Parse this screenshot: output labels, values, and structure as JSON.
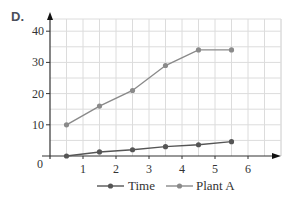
{
  "panel_label": "D.",
  "colors": {
    "time_series": "#555555",
    "plant_a_series": "#8a8a8a",
    "grid": "#dcdcdc",
    "axis": "#333333",
    "text": "#333333"
  },
  "chart_data": {
    "type": "line",
    "title": "",
    "xlabel": "",
    "ylabel": "",
    "x": [
      0.5,
      1.5,
      2.5,
      3.5,
      4.5,
      5.5
    ],
    "series": [
      {
        "name": "Time",
        "values": [
          0,
          1.3,
          2,
          3,
          3.6,
          4.6
        ]
      },
      {
        "name": "Plant A",
        "values": [
          10,
          16,
          21,
          29,
          34,
          34
        ]
      }
    ],
    "xlim": [
      0,
      7
    ],
    "ylim": [
      0,
      43
    ],
    "x_ticks": [
      1,
      2,
      3,
      4,
      5,
      6
    ],
    "y_ticks": [
      10,
      20,
      30,
      40
    ],
    "origin_label": "0",
    "grid": true,
    "grid_step_x": 0.5,
    "grid_step_y": 5,
    "legend": {
      "position": "bottom",
      "entries": [
        "Time",
        "Plant A"
      ]
    }
  }
}
